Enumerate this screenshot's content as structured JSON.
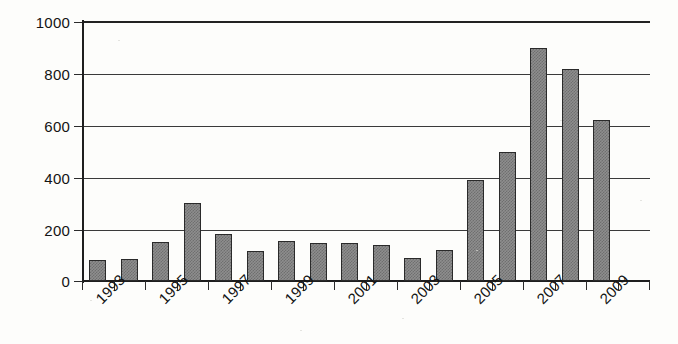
{
  "chart_data": {
    "type": "bar",
    "title": "",
    "xlabel": "",
    "ylabel": "",
    "categories": [
      "1993",
      "1994",
      "1995",
      "1996",
      "1997",
      "1998",
      "1999",
      "2000",
      "2001",
      "2002",
      "2003",
      "2004",
      "2005",
      "2006",
      "2007",
      "2008",
      "2009"
    ],
    "values": [
      80,
      85,
      150,
      300,
      180,
      115,
      155,
      145,
      148,
      140,
      88,
      118,
      390,
      495,
      895,
      815,
      618
    ],
    "series": [
      {
        "name": "count",
        "values": [
          80,
          85,
          150,
          300,
          180,
          115,
          155,
          145,
          148,
          140,
          88,
          118,
          390,
          495,
          895,
          815,
          618
        ]
      }
    ],
    "ylim": [
      0,
      1000
    ],
    "ytick_values": [
      0,
      200,
      400,
      600,
      800,
      1000
    ],
    "ytick_labels": [
      "0",
      "200",
      "400",
      "600",
      "800",
      "1000"
    ],
    "xtick_labels_shown": [
      "1993",
      "1995",
      "1997",
      "1999",
      "2001",
      "2003",
      "2005",
      "2007",
      "2009"
    ],
    "xtick_label_rotation": -45,
    "grid": "horizontal",
    "legend": "none",
    "bar_fill_color": "#8e8e8e",
    "bar_edge_color": "#2a2a2a",
    "axis_color": "#1e1e1e",
    "background_color": "#fdfdfb"
  }
}
